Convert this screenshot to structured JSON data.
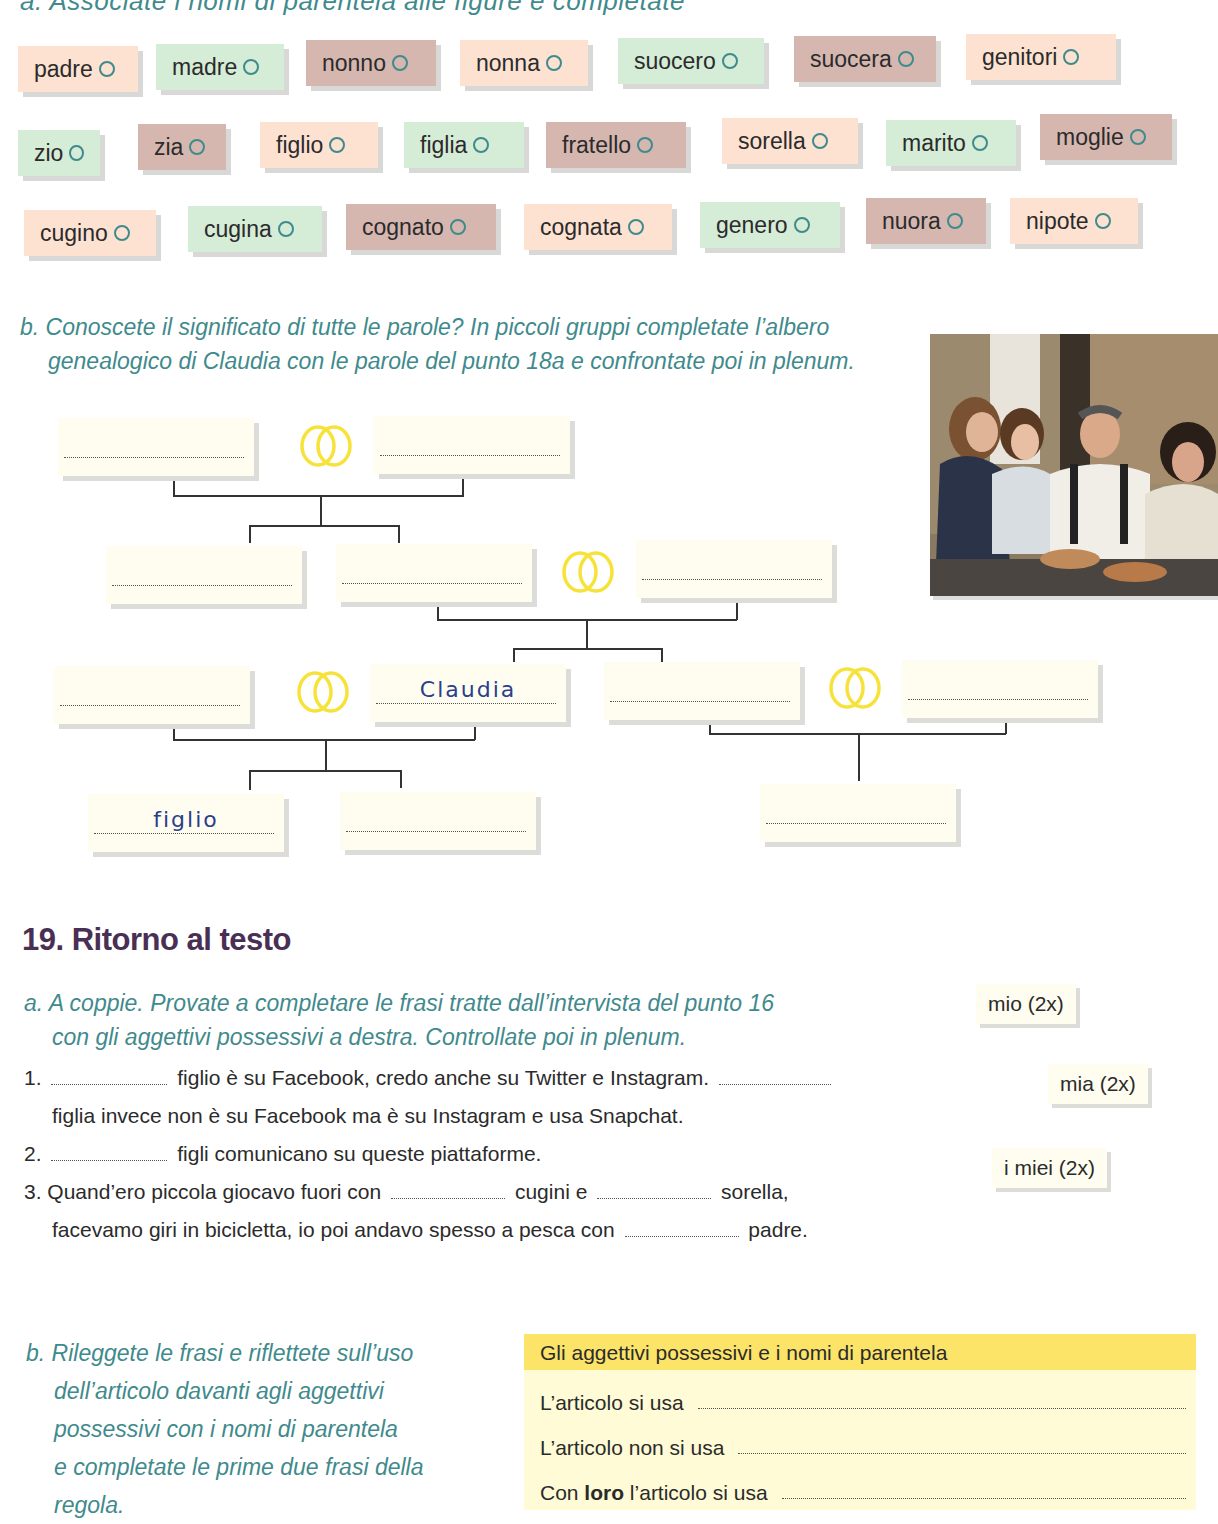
{
  "section18a": {
    "instruction_partial": "a. Associate i nomi di parentela alle figure e completate",
    "tags": [
      {
        "label": "padre",
        "color": "peach",
        "x": 18,
        "y": 46,
        "w": 120
      },
      {
        "label": "madre",
        "color": "green",
        "x": 156,
        "y": 44,
        "w": 128
      },
      {
        "label": "nonno",
        "color": "mauve",
        "x": 306,
        "y": 40,
        "w": 130
      },
      {
        "label": "nonna",
        "color": "peach",
        "x": 460,
        "y": 40,
        "w": 128
      },
      {
        "label": "suocero",
        "color": "green",
        "x": 618,
        "y": 38,
        "w": 146
      },
      {
        "label": "suocera",
        "color": "mauve",
        "x": 794,
        "y": 36,
        "w": 142
      },
      {
        "label": "genitori",
        "color": "peach",
        "x": 966,
        "y": 34,
        "w": 150
      },
      {
        "label": "zio",
        "color": "green",
        "x": 18,
        "y": 130,
        "w": 82
      },
      {
        "label": "zia",
        "color": "mauve",
        "x": 138,
        "y": 124,
        "w": 88
      },
      {
        "label": "figlio",
        "color": "peach",
        "x": 260,
        "y": 122,
        "w": 118
      },
      {
        "label": "figlia",
        "color": "green",
        "x": 404,
        "y": 122,
        "w": 120
      },
      {
        "label": "fratello",
        "color": "mauve",
        "x": 546,
        "y": 122,
        "w": 140
      },
      {
        "label": "sorella",
        "color": "peach",
        "x": 722,
        "y": 118,
        "w": 136
      },
      {
        "label": "marito",
        "color": "green",
        "x": 886,
        "y": 120,
        "w": 130
      },
      {
        "label": "moglie",
        "color": "mauve",
        "x": 1040,
        "y": 114,
        "w": 132
      },
      {
        "label": "cugino",
        "color": "peach",
        "x": 24,
        "y": 210,
        "w": 132
      },
      {
        "label": "cugina",
        "color": "green",
        "x": 188,
        "y": 206,
        "w": 134
      },
      {
        "label": "cognato",
        "color": "mauve",
        "x": 346,
        "y": 204,
        "w": 150
      },
      {
        "label": "cognata",
        "color": "peach",
        "x": 524,
        "y": 204,
        "w": 148
      },
      {
        "label": "genero",
        "color": "green",
        "x": 700,
        "y": 202,
        "w": 140
      },
      {
        "label": "nuora",
        "color": "mauve",
        "x": 866,
        "y": 198,
        "w": 120
      },
      {
        "label": "nipote",
        "color": "peach",
        "x": 1010,
        "y": 198,
        "w": 128
      }
    ]
  },
  "section18b": {
    "instruction_line1": "b. Conoscete il significato di tutte le parole? In piccoli gruppi completate l’albero",
    "instruction_line2": "genealogico di Claudia con le parole del punto 18a e confrontate poi in plenum.",
    "photo_alt": "family-photo",
    "tree": {
      "boxes": [
        {
          "id": "gen1-left",
          "x": 58,
          "y": 418,
          "value": ""
        },
        {
          "id": "gen1-right",
          "x": 374,
          "y": 416,
          "value": ""
        },
        {
          "id": "gen2-a",
          "x": 106,
          "y": 546,
          "value": ""
        },
        {
          "id": "gen2-b",
          "x": 336,
          "y": 544,
          "value": ""
        },
        {
          "id": "gen2-spouse",
          "x": 636,
          "y": 540,
          "value": ""
        },
        {
          "id": "gen3-spouse-claudia",
          "x": 54,
          "y": 666,
          "value": ""
        },
        {
          "id": "gen3-claudia",
          "x": 370,
          "y": 664,
          "value": "Claudia"
        },
        {
          "id": "gen3-sibling",
          "x": 604,
          "y": 662,
          "value": ""
        },
        {
          "id": "gen3-sibling-spouse",
          "x": 902,
          "y": 660,
          "value": ""
        },
        {
          "id": "gen4-a",
          "x": 88,
          "y": 794,
          "value": "figlio"
        },
        {
          "id": "gen4-b",
          "x": 340,
          "y": 792,
          "value": ""
        },
        {
          "id": "gen4-c",
          "x": 760,
          "y": 784,
          "value": ""
        }
      ]
    }
  },
  "section19": {
    "title": "19. Ritorno al testo",
    "a_line1": "a. A coppie. Provate a completare le frasi tratte dall’intervista del punto 16",
    "a_line2": "con gli aggettivi possessivi a destra. Controllate poi in plenum.",
    "sentences": {
      "s1_num": "1.",
      "s1_part1": "figlio è su Facebook, credo anche su Twitter e Instagram.",
      "s1_part2": "figlia invece non è su Facebook ma è su Instagram e usa Snapchat.",
      "s2_num": "2.",
      "s2_part1": "figli comunicano su queste piattaforme.",
      "s3_num": "3.",
      "s3_part1": "Quand’ero piccola giocavo fuori con",
      "s3_part2": "cugini e",
      "s3_part3": "sorella,",
      "s3_part4": "facevamo giri in bicicletta, io poi andavo spesso a pesca con",
      "s3_part5": "padre."
    },
    "chips": [
      {
        "label": "mio (2x)",
        "x": 976,
        "y": 984
      },
      {
        "label": "mia (2x)",
        "x": 1048,
        "y": 1064
      },
      {
        "label": "i miei (2x)",
        "x": 992,
        "y": 1148
      }
    ],
    "b_lines": [
      "b. Rileggete le frasi e riflettete sull’uso",
      "dell’articolo davanti agli aggettivi",
      "possessivi con i nomi di parentela",
      "e completate le prime due frasi della",
      "regola."
    ],
    "rule_box": {
      "title": "Gli aggettivi possessivi e i nomi di parentela",
      "row1": "L’articolo si usa",
      "row2": "L’articolo non si usa",
      "row3_pre": "Con ",
      "row3_bold": "loro",
      "row3_post": " l’articolo si usa"
    }
  }
}
